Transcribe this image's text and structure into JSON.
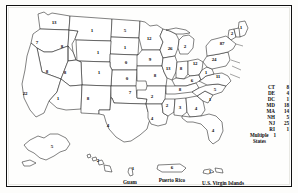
{
  "figure": {
    "frame_color": "#111111",
    "land_fill": "#ffffff",
    "border_color": "#1a1a1a"
  },
  "states": [
    {
      "abbr": "WA",
      "name": "Washington",
      "count": "13",
      "x": 54,
      "y": 22
    },
    {
      "abbr": "OR",
      "name": "Oregon",
      "count": "7",
      "x": 37,
      "y": 42
    },
    {
      "abbr": "ID",
      "name": "Idaho",
      "count": "8",
      "x": 62,
      "y": 46
    },
    {
      "abbr": "MT",
      "name": "Montana",
      "count": "1",
      "x": 92,
      "y": 30
    },
    {
      "abbr": "ND",
      "name": "North Dakota",
      "count": "5",
      "x": 125,
      "y": 30
    },
    {
      "abbr": "SD",
      "name": "South Dakota",
      "count": "1",
      "x": 125,
      "y": 47
    },
    {
      "abbr": "WY",
      "name": "Wyoming",
      "count": "1",
      "x": 98,
      "y": 52
    },
    {
      "abbr": "NV",
      "name": "Nevada",
      "count": "8",
      "x": 47,
      "y": 71
    },
    {
      "abbr": "CA",
      "name": "California",
      "count": "22",
      "x": 25,
      "y": 93
    },
    {
      "abbr": "UT",
      "name": "Utah",
      "count": "8",
      "x": 65,
      "y": 72
    },
    {
      "abbr": "CO",
      "name": "Colorado",
      "count": "1",
      "x": 99,
      "y": 72
    },
    {
      "abbr": "NE",
      "name": "Nebraska",
      "count": "0",
      "x": 126,
      "y": 62
    },
    {
      "abbr": "KS",
      "name": "Kansas",
      "count": "0",
      "x": 127,
      "y": 78
    },
    {
      "abbr": "AZ",
      "name": "Arizona",
      "count": "1",
      "x": 58,
      "y": 98
    },
    {
      "abbr": "NM",
      "name": "New Mexico",
      "count": "8",
      "x": 88,
      "y": 98
    },
    {
      "abbr": "OK",
      "name": "Oklahoma",
      "count": "7",
      "x": 130,
      "y": 92
    },
    {
      "abbr": "TX",
      "name": "Texas",
      "count": "4",
      "x": 108,
      "y": 125
    },
    {
      "abbr": "MN",
      "name": "Minnesota",
      "count": "12",
      "x": 149,
      "y": 38
    },
    {
      "abbr": "IA",
      "name": "Iowa",
      "count": "9",
      "x": 150,
      "y": 59
    },
    {
      "abbr": "MO",
      "name": "Missouri",
      "count": "8",
      "x": 155,
      "y": 75
    },
    {
      "abbr": "AR",
      "name": "Arkansas",
      "count": "2",
      "x": 152,
      "y": 96
    },
    {
      "abbr": "LA",
      "name": "Louisiana",
      "count": "4",
      "x": 152,
      "y": 118
    },
    {
      "abbr": "WI",
      "name": "Wisconsin",
      "count": "26",
      "x": 170,
      "y": 48
    },
    {
      "abbr": "IL",
      "name": "Illinois",
      "count": "13",
      "x": 168,
      "y": 68
    },
    {
      "abbr": "MS",
      "name": "Mississippi",
      "count": "2",
      "x": 167,
      "y": 105
    },
    {
      "abbr": "MI",
      "name": "Michigan",
      "count": "2",
      "x": 185,
      "y": 46
    },
    {
      "abbr": "IN",
      "name": "Indiana",
      "count": "8",
      "x": 181,
      "y": 68
    },
    {
      "abbr": "TN",
      "name": "Tennessee",
      "count": "8",
      "x": 180,
      "y": 89
    },
    {
      "abbr": "AL",
      "name": "Alabama",
      "count": "3",
      "x": 180,
      "y": 107
    },
    {
      "abbr": "OH",
      "name": "Ohio",
      "count": "12",
      "x": 195,
      "y": 63
    },
    {
      "abbr": "KY",
      "name": "Kentucky",
      "count": "6",
      "x": 192,
      "y": 80
    },
    {
      "abbr": "GA",
      "name": "Georgia",
      "count": "4",
      "x": 196,
      "y": 108
    },
    {
      "abbr": "FL",
      "name": "Florida",
      "count": "4",
      "x": 213,
      "y": 130
    },
    {
      "abbr": "PA",
      "name": "Pennsylvania",
      "count": "24",
      "x": 214,
      "y": 59
    },
    {
      "abbr": "WV",
      "name": "West Virginia",
      "count": "1",
      "x": 206,
      "y": 72
    },
    {
      "abbr": "VA",
      "name": "Virginia",
      "count": "11",
      "x": 218,
      "y": 76
    },
    {
      "abbr": "NC",
      "name": "North Carolina",
      "count": "5",
      "x": 215,
      "y": 89
    },
    {
      "abbr": "SC",
      "name": "South Carolina",
      "count": "1",
      "x": 210,
      "y": 99
    },
    {
      "abbr": "NY",
      "name": "New York",
      "count": "87",
      "x": 222,
      "y": 43
    },
    {
      "abbr": "VT",
      "name": "Vermont",
      "count": "2",
      "x": 232,
      "y": 33
    },
    {
      "abbr": "ME",
      "name": "Maine",
      "count": "1",
      "x": 241,
      "y": 27
    },
    {
      "abbr": "AK",
      "name": "Alaska",
      "count": "5",
      "x": 52,
      "y": 146
    },
    {
      "abbr": "HI",
      "name": "Hawaii",
      "count": "2",
      "x": 98,
      "y": 160
    }
  ],
  "territories": [
    {
      "name": "Guam",
      "count": "1",
      "label_x": 130,
      "label_y": 180,
      "count_x": 133,
      "count_y": 168
    },
    {
      "name": "Puerto Rico",
      "count": "6",
      "label_x": 172,
      "label_y": 178,
      "count_x": 172,
      "count_y": 167
    },
    {
      "name": "U.S. Virgin Islands",
      "count": "1",
      "label_x": 223,
      "label_y": 181,
      "count_x": 210,
      "count_y": 171
    }
  ],
  "legend": {
    "entries": [
      {
        "abbr": "CT",
        "name": "Connecticut",
        "count": "8"
      },
      {
        "abbr": "DE",
        "name": "Delaware",
        "count": "4"
      },
      {
        "abbr": "DC",
        "name": "District of Columbia",
        "count": "1"
      },
      {
        "abbr": "MD",
        "name": "Maryland",
        "count": "18"
      },
      {
        "abbr": "MA",
        "name": "Massachusetts",
        "count": "14"
      },
      {
        "abbr": "NH",
        "name": "New Hampshire",
        "count": "5"
      },
      {
        "abbr": "NJ",
        "name": "New Jersey",
        "count": "25"
      },
      {
        "abbr": "RI",
        "name": "Rhode Island",
        "count": "1"
      }
    ],
    "multiple_line1": "Multiple",
    "multiple_line2": "States",
    "multiple_count": "1"
  }
}
